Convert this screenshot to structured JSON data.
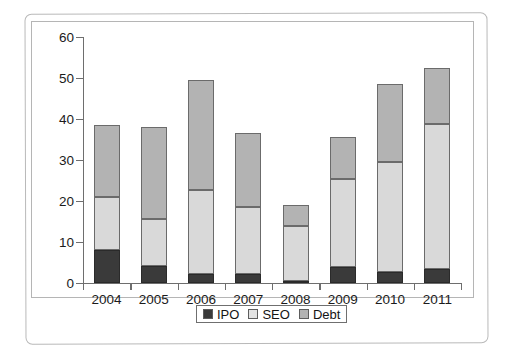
{
  "chart_data": {
    "type": "bar",
    "subtype": "stacked-bar",
    "title": "",
    "xlabel": "",
    "ylabel": "",
    "categories": [
      "2004",
      "2005",
      "2006",
      "2007",
      "2008",
      "2009",
      "2010",
      "2011"
    ],
    "series": [
      {
        "name": "IPO",
        "color": "#3a3a3a",
        "values": [
          8.1,
          4.1,
          2.3,
          2.1,
          0.6,
          3.9,
          2.6,
          3.4
        ]
      },
      {
        "name": "SEO",
        "color": "#d9d9d9",
        "values": [
          12.9,
          11.6,
          20.4,
          16.4,
          13.2,
          21.4,
          26.9,
          35.3
        ]
      },
      {
        "name": "Debt",
        "color": "#b3b3b3",
        "values": [
          17.5,
          22.3,
          26.8,
          18.2,
          5.2,
          10.2,
          19.0,
          13.8
        ]
      }
    ],
    "totals": [
      38.5,
      38.0,
      49.5,
      36.7,
      19.0,
      35.5,
      48.5,
      52.5
    ],
    "ylim": [
      0,
      60
    ],
    "yticks": [
      0,
      10,
      20,
      30,
      40,
      50,
      60
    ],
    "ytick_labels": [
      "0",
      "10",
      "20",
      "30",
      "40",
      "50",
      "60"
    ],
    "grid": false,
    "legend_position": "bottom-center",
    "stack_order_bottom_to_top": [
      "IPO",
      "SEO",
      "Debt"
    ]
  },
  "legend": {
    "items": [
      {
        "label": "IPO",
        "swatch": "ipo-swatch"
      },
      {
        "label": "SEO",
        "swatch": "seo-swatch"
      },
      {
        "label": "Debt",
        "swatch": "debt-swatch"
      }
    ]
  },
  "colors": {
    "ipo": "#3a3a3a",
    "seo": "#d9d9d9",
    "debt": "#b3b3b3",
    "axis": "#6e6e6e",
    "frame": "#b9b9b9",
    "text": "#1b1b1b"
  }
}
